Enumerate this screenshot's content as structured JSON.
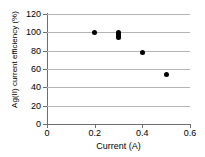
{
  "chart_data": {
    "type": "scatter",
    "title": "",
    "xlabel": "Current (A)",
    "ylabel": "Ag(II) current efficiency (%)",
    "xlim": [
      0,
      0.6
    ],
    "ylim": [
      0,
      120
    ],
    "xticks": [
      0,
      0.2,
      0.4,
      0.6
    ],
    "xtick_labels": [
      "0",
      "0.2",
      "0.4",
      "0.6"
    ],
    "yticks": [
      0,
      20,
      40,
      60,
      80,
      100,
      120
    ],
    "ytick_labels": [
      "0",
      "20",
      "40",
      "60",
      "80",
      "100",
      "120"
    ],
    "grid": "horizontal",
    "legend": "none",
    "marker": "filled-diamond",
    "marker_color": "#000000",
    "series": [
      {
        "name": "Ag(II) current efficiency",
        "points": [
          {
            "x": 0.2,
            "y": 100
          },
          {
            "x": 0.3,
            "y": 100
          },
          {
            "x": 0.3,
            "y": 98
          },
          {
            "x": 0.3,
            "y": 96
          },
          {
            "x": 0.3,
            "y": 94
          },
          {
            "x": 0.4,
            "y": 78
          },
          {
            "x": 0.5,
            "y": 54
          }
        ]
      }
    ]
  }
}
